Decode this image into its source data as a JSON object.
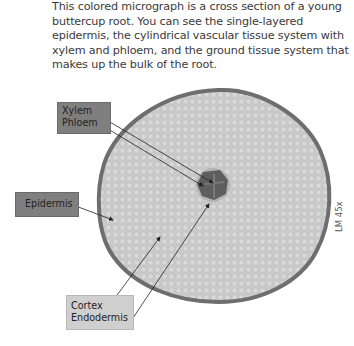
{
  "caption": "This colored micrograph is a cross section of a young buttercup root. You can see the single-layered epidermis, the cylindrical vascular tissue system with xylem and phloem, and the ground tissue system that makes up the bulk of the root.",
  "labels": {
    "xylem": "Xylem",
    "phloem": "Phloem",
    "epidermis": "Epidermis",
    "cortex": "Cortex",
    "endodermis": "Endodermis"
  },
  "scale_label": "LM 45x",
  "colors": {
    "tissue_fill": "#c8c8c8",
    "epidermis_ring": "#6e6e6e",
    "vascular_core": "#5e5e5e",
    "dark_label_bg": "#7f7f7f",
    "light_label_bg": "#cfcfcf"
  }
}
